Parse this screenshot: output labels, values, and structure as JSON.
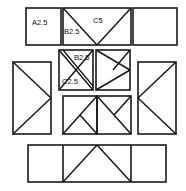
{
  "diagram": {
    "type": "technical-line-drawing",
    "canvas": {
      "width": 186,
      "height": 191
    },
    "colors": {
      "background": "#ffffff",
      "stroke": "#1a1a1a",
      "label_text": "#111111"
    },
    "stroke_widths": {
      "outline": 1.6,
      "diagonal": 1.5
    },
    "labels": [
      {
        "id": "a25",
        "text": "A2.5",
        "x": 33,
        "y": 23
      },
      {
        "id": "c5",
        "text": "C5",
        "x": 95,
        "y": 20
      },
      {
        "id": "b25_top",
        "text": "B2.5",
        "x": 66,
        "y": 31
      },
      {
        "id": "b25_mid",
        "text": "B2.5",
        "x": 76,
        "y": 59
      },
      {
        "id": "c25",
        "text": "C2.5",
        "x": 64,
        "y": 83
      }
    ],
    "panels": [
      {
        "id": "top-left",
        "name": "panel-a25",
        "label": "A2.5",
        "pattern": "blank",
        "x": 26,
        "y": 8,
        "w": 35,
        "h": 37
      },
      {
        "id": "top-center",
        "name": "panel-c5",
        "label": "C5",
        "pattern": "v-shape",
        "x": 63,
        "y": 8,
        "w": 68,
        "h": 37
      },
      {
        "id": "top-right",
        "name": "panel-top-right",
        "label": "",
        "pattern": "blank",
        "x": 133,
        "y": 8,
        "w": 44,
        "h": 37
      },
      {
        "id": "mid-inner-left",
        "name": "panel-b25-c25",
        "label": "B2.5 / C2.5",
        "pattern": "double-diagonal",
        "x": 59,
        "y": 50,
        "w": 34,
        "h": 40
      },
      {
        "id": "mid-inner-right",
        "name": "panel-right-chevron",
        "label": "",
        "pattern": "right-chevron",
        "x": 96,
        "y": 50,
        "w": 34,
        "h": 40
      },
      {
        "id": "mid-left-tall",
        "name": "panel-left-tall",
        "label": "",
        "pattern": "right-chevron",
        "x": 13,
        "y": 62,
        "w": 38,
        "h": 72
      },
      {
        "id": "mid-right-tall",
        "name": "panel-right-tall",
        "label": "",
        "pattern": "left-chevron",
        "x": 138,
        "y": 62,
        "w": 38,
        "h": 72
      },
      {
        "id": "ctr-bottom-left",
        "name": "panel-center-left",
        "label": "",
        "pattern": "k-shape",
        "x": 63,
        "y": 96,
        "w": 34,
        "h": 38
      },
      {
        "id": "ctr-bottom-right",
        "name": "panel-center-right",
        "label": "",
        "pattern": "peak-right",
        "x": 97,
        "y": 96,
        "w": 34,
        "h": 38
      },
      {
        "id": "bottom-left",
        "name": "panel-bottom-left",
        "label": "",
        "pattern": "blank",
        "x": 28,
        "y": 145,
        "w": 35,
        "h": 37
      },
      {
        "id": "bottom-center",
        "name": "panel-bottom-center",
        "label": "",
        "pattern": "peak",
        "x": 63,
        "y": 145,
        "w": 68,
        "h": 37
      },
      {
        "id": "bottom-right",
        "name": "panel-bottom-right",
        "label": "",
        "pattern": "blank",
        "x": 131,
        "y": 145,
        "w": 35,
        "h": 37
      }
    ]
  }
}
